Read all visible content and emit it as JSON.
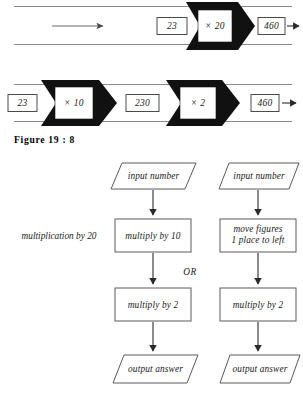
{
  "figure": {
    "caption": "Figure  19 : 8",
    "band_top": {
      "lead_arrow": "arrow-right",
      "input_value": "23",
      "operation": "× 20",
      "output_value": "460",
      "exit_arrow": "arrow-right"
    },
    "band_bottom": {
      "input_value": "23",
      "operation_first": "× 10",
      "intermediate_value": "230",
      "operation_second": "× 2",
      "output_value": "460",
      "exit_arrow": "arrow-right"
    }
  },
  "flowchart": {
    "side_label": "multiplication by 20",
    "or_label": "OR",
    "left_column": {
      "steps": [
        {
          "shape": "parallelogram",
          "text": "input number"
        },
        {
          "shape": "rectangle",
          "text": "multiply by 10"
        },
        {
          "shape": "rectangle",
          "text": "multiply by 2"
        },
        {
          "shape": "parallelogram",
          "text": "output answer"
        }
      ]
    },
    "right_column": {
      "steps": [
        {
          "shape": "parallelogram",
          "text": "input number"
        },
        {
          "shape": "rectangle",
          "text_line1": "move figures",
          "text_line2": "1 place to left"
        },
        {
          "shape": "rectangle",
          "text": "multiply by 2"
        },
        {
          "shape": "parallelogram",
          "text": "output answer"
        }
      ]
    }
  },
  "colors": {
    "ink": "#1a1a1a",
    "rule": "#8a8a8a",
    "block": "#111111",
    "paper": "#ffffff"
  }
}
